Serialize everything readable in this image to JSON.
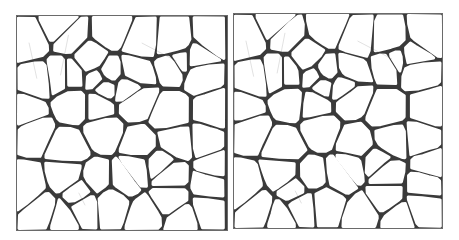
{
  "figure": {
    "panels": [
      {
        "id": "left",
        "x": 16,
        "y": 15,
        "w": 212,
        "h": 216,
        "seed": 7
      },
      {
        "id": "right",
        "x": 233,
        "y": 13,
        "w": 210,
        "h": 216,
        "seed": 7
      }
    ],
    "colors": {
      "edge": "#2a2a2a",
      "cell": "#ffffff",
      "frame": "#6a6a6a",
      "background": "#ffffff"
    }
  }
}
